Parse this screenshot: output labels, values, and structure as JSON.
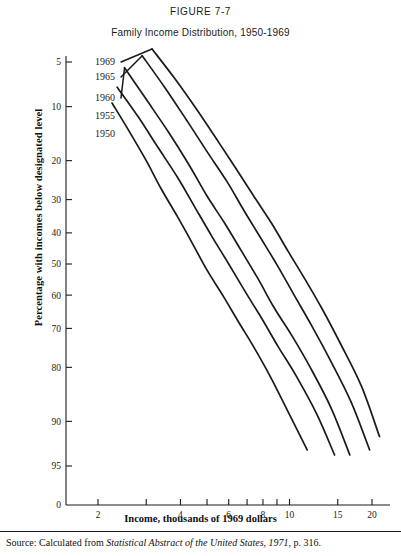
{
  "figure": {
    "number": "FIGURE 7-7",
    "title": "Family Income Distribution, 1950-1969",
    "source_prefix": "Source: Calculated from ",
    "source_italic": "Statistical Abstract of the United States, 1971",
    "source_suffix": ", p. 316."
  },
  "axes": {
    "xlabel": "Income, thousands of 1969 dollars",
    "ylabel": "Percentage with incomes below designated level",
    "origin_label": "0"
  },
  "chart_data": {
    "type": "line",
    "title": "Family Income Distribution, 1950-1969",
    "subtitle": "FIGURE 7-7",
    "xlabel": "Income, thousands of 1969 dollars",
    "ylabel": "Percentage with incomes below designated level",
    "x_scale": "log",
    "y_scale": "normal-probability",
    "xlim": [
      1.7,
      22
    ],
    "ylim": [
      3.5,
      97
    ],
    "grid": false,
    "legend": "inline-left-labels",
    "xticks": [
      2,
      3,
      4,
      5,
      6,
      7,
      8,
      9,
      10,
      15,
      20
    ],
    "xtick_labels": [
      "2",
      "3",
      "4",
      "5",
      "6",
      "7",
      "8",
      "9",
      "10",
      "15",
      "20"
    ],
    "xtick_labels_shown": [
      "2",
      "",
      "4",
      "",
      "6",
      "",
      "8",
      "",
      "10",
      "15",
      "20"
    ],
    "yticks": [
      5,
      10,
      20,
      30,
      40,
      50,
      60,
      70,
      80,
      90,
      95
    ],
    "ytick_labels": [
      "5",
      "10",
      "20",
      "30",
      "40",
      "50",
      "60",
      "70",
      "80",
      "90",
      "95"
    ],
    "series": [
      {
        "name": "1950",
        "label": "1950",
        "points": [
          {
            "income": 2.25,
            "percent": 9.5
          },
          {
            "income": 2.6,
            "percent": 14
          },
          {
            "income": 3.0,
            "percent": 20
          },
          {
            "income": 3.4,
            "percent": 27
          },
          {
            "income": 3.9,
            "percent": 35
          },
          {
            "income": 4.4,
            "percent": 43
          },
          {
            "income": 5.0,
            "percent": 52
          },
          {
            "income": 5.7,
            "percent": 60
          },
          {
            "income": 6.5,
            "percent": 68
          },
          {
            "income": 7.4,
            "percent": 75
          },
          {
            "income": 8.5,
            "percent": 82
          },
          {
            "income": 10.0,
            "percent": 89
          },
          {
            "income": 11.6,
            "percent": 93.5
          }
        ]
      },
      {
        "name": "1955",
        "label": "1955",
        "points": [
          {
            "income": 2.35,
            "percent": 7.5
          },
          {
            "income": 2.8,
            "percent": 11.5
          },
          {
            "income": 3.3,
            "percent": 17
          },
          {
            "income": 3.9,
            "percent": 24
          },
          {
            "income": 4.5,
            "percent": 32
          },
          {
            "income": 5.2,
            "percent": 41
          },
          {
            "income": 6.0,
            "percent": 50
          },
          {
            "income": 6.9,
            "percent": 59
          },
          {
            "income": 7.9,
            "percent": 67
          },
          {
            "income": 9.1,
            "percent": 75
          },
          {
            "income": 10.6,
            "percent": 82
          },
          {
            "income": 12.6,
            "percent": 89
          },
          {
            "income": 14.6,
            "percent": 94
          }
        ]
      },
      {
        "name": "1960",
        "label": "1960",
        "points": [
          {
            "income": 2.5,
            "percent": 5.5
          },
          {
            "income": 3.0,
            "percent": 9
          },
          {
            "income": 3.6,
            "percent": 14
          },
          {
            "income": 4.3,
            "percent": 21
          },
          {
            "income": 5.0,
            "percent": 29
          },
          {
            "income": 5.8,
            "percent": 37
          },
          {
            "income": 6.7,
            "percent": 46
          },
          {
            "income": 7.7,
            "percent": 55
          },
          {
            "income": 8.8,
            "percent": 64
          },
          {
            "income": 10.2,
            "percent": 72
          },
          {
            "income": 11.9,
            "percent": 80
          },
          {
            "income": 14.2,
            "percent": 88
          },
          {
            "income": 16.6,
            "percent": 94
          }
        ]
      },
      {
        "name": "1965",
        "label": "1965",
        "points": [
          {
            "income": 2.9,
            "percent": 4.5
          },
          {
            "income": 3.5,
            "percent": 7.5
          },
          {
            "income": 4.2,
            "percent": 12
          },
          {
            "income": 5.0,
            "percent": 18
          },
          {
            "income": 5.9,
            "percent": 25
          },
          {
            "income": 6.8,
            "percent": 33
          },
          {
            "income": 7.9,
            "percent": 42
          },
          {
            "income": 9.1,
            "percent": 51
          },
          {
            "income": 10.4,
            "percent": 60
          },
          {
            "income": 12.0,
            "percent": 69
          },
          {
            "income": 14.0,
            "percent": 78
          },
          {
            "income": 16.8,
            "percent": 87
          },
          {
            "income": 19.6,
            "percent": 93.5
          }
        ]
      },
      {
        "name": "1969",
        "label": "1969",
        "points": [
          {
            "income": 3.15,
            "percent": 4
          },
          {
            "income": 3.8,
            "percent": 6.5
          },
          {
            "income": 4.6,
            "percent": 10.5
          },
          {
            "income": 5.5,
            "percent": 16
          },
          {
            "income": 6.4,
            "percent": 22
          },
          {
            "income": 7.4,
            "percent": 29
          },
          {
            "income": 8.6,
            "percent": 37
          },
          {
            "income": 9.9,
            "percent": 46
          },
          {
            "income": 11.4,
            "percent": 55
          },
          {
            "income": 13.1,
            "percent": 64
          },
          {
            "income": 15.3,
            "percent": 74
          },
          {
            "income": 18.3,
            "percent": 84
          },
          {
            "income": 21.3,
            "percent": 92
          }
        ]
      }
    ]
  }
}
